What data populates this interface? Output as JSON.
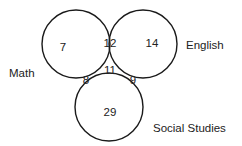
{
  "diagram": {
    "type": "venn",
    "sets": [
      {
        "name": "Math",
        "label": "Math",
        "cx": 76,
        "cy": 44,
        "r": 34
      },
      {
        "name": "English",
        "label": "English",
        "cx": 143,
        "cy": 44,
        "r": 34
      },
      {
        "name": "Social Studies",
        "label": "Social Studies",
        "cx": 109,
        "cy": 107,
        "r": 34
      }
    ],
    "regions": {
      "math_only": "7",
      "math_english": "12",
      "english_only": "14",
      "all_three": "11",
      "math_social": "8",
      "english_social": "9",
      "social_only": "29"
    },
    "stroke_color": "#1a1a1a",
    "text_color": "#222222"
  }
}
